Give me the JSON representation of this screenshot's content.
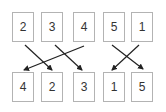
{
  "diagram": {
    "top_row": [
      "2",
      "3",
      "4",
      "5",
      "1"
    ],
    "bottom_row": [
      "4",
      "2",
      "3",
      "1",
      "5"
    ],
    "arrows": [
      {
        "from": "2",
        "to": "2"
      },
      {
        "from": "3",
        "to": "3"
      },
      {
        "from": "4",
        "to": "4"
      },
      {
        "from": "5",
        "to": "5"
      },
      {
        "from": "1",
        "to": "1"
      }
    ],
    "colors": {
      "box_border": "#b3b3b3",
      "arrow": "#222222",
      "text": "#333333"
    }
  }
}
